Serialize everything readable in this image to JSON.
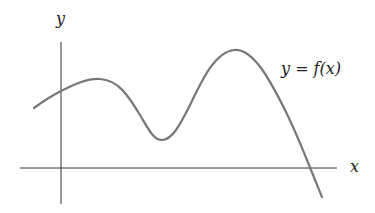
{
  "diagram": {
    "type": "function-graph",
    "axis_labels": {
      "x": "x",
      "y": "y"
    },
    "curve_label": "y = f(x)",
    "colors": {
      "axes": "#333333",
      "curve": "#777777",
      "text": "#222222"
    },
    "curve_features": [
      "starts left of y-axis below y-intercept",
      "local maximum just right of y-axis",
      "local minimum above x-axis",
      "global maximum",
      "crosses x-axis once on the right, then decreases"
    ]
  }
}
